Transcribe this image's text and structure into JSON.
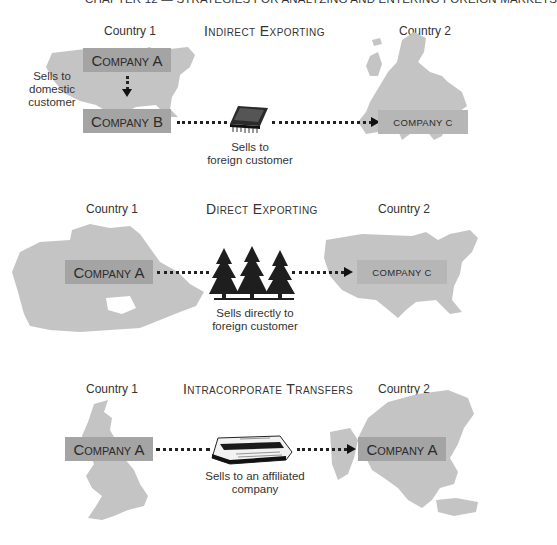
{
  "header": {
    "text": "CHAPTER 12 — STRATEGIES FOR ANALYZING AND ENTERING FOREIGN MARKETS"
  },
  "sections": [
    {
      "title": "Indirect Exporting",
      "country1_label": "Country 1",
      "country2_label": "Country 2",
      "country1_map": "usa-map",
      "country2_map": "europe-map",
      "boxes": {
        "company_a": "Company A",
        "company_b": "Company B",
        "company_c": "COMPANY C"
      },
      "side_caption": [
        "Sells to",
        "domestic",
        "customer"
      ],
      "product_icon": "microchip-icon",
      "caption": [
        "Sells to",
        "foreign customer"
      ]
    },
    {
      "title": "Direct Exporting",
      "country1_label": "Country 1",
      "country2_label": "Country 2",
      "country1_map": "canada-map",
      "country2_map": "usa-map",
      "boxes": {
        "company_a": "Company A",
        "company_c": "COMPANY C"
      },
      "product_icon": "pine-trees-icon",
      "caption": [
        "Sells directly to",
        "foreign customer"
      ]
    },
    {
      "title": "Intracorporate Transfers",
      "country1_label": "Country 1",
      "country2_label": "Country 2",
      "country1_map": "uk-map",
      "country2_map": "asia-map",
      "boxes": {
        "company_a": "Company A",
        "company_a2": "Company A"
      },
      "product_icon": "newspaper-icon",
      "caption": [
        "Sells to an affiliated",
        "company"
      ]
    }
  ],
  "colors": {
    "map": "#c4c4c4",
    "box_dark": "#a4a4a4",
    "box_light": "#b6b6b6",
    "text": "#2b2b2b"
  }
}
